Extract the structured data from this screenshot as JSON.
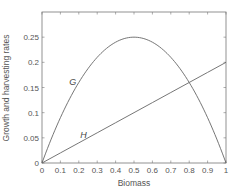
{
  "chart_data": {
    "type": "line",
    "title": "",
    "xlabel": "Biomass",
    "ylabel": "Growth and harvesting rates",
    "xlim": [
      0,
      1
    ],
    "ylim": [
      0,
      0.3
    ],
    "grid": false,
    "legend": "none (inline curve labels)",
    "x_ticks": [
      "0",
      "0.1",
      "0.2",
      "0.3",
      "0.4",
      "0.5",
      "0.6",
      "0.7",
      "0.8",
      "0.9",
      "1"
    ],
    "y_ticks": [
      "0",
      "0.05",
      "0.1",
      "0.15",
      "0.2",
      "0.25"
    ],
    "x": [
      0,
      0.1,
      0.2,
      0.3,
      0.4,
      0.5,
      0.6,
      0.7,
      0.8,
      0.9,
      1.0
    ],
    "series": [
      {
        "name": "G",
        "description": "logistic growth curve",
        "values": [
          0,
          0.09,
          0.16,
          0.21,
          0.24,
          0.25,
          0.24,
          0.21,
          0.16,
          0.09,
          0
        ],
        "color": "#666666"
      },
      {
        "name": "H",
        "description": "harvesting line",
        "values": [
          0,
          0.02,
          0.04,
          0.06,
          0.08,
          0.1,
          0.12,
          0.14,
          0.16,
          0.18,
          0.2
        ],
        "color": "#666666"
      }
    ],
    "annotations": [
      {
        "text": "G",
        "x": 0.17,
        "y": 0.16
      },
      {
        "text": "H",
        "x": 0.23,
        "y": 0.055
      }
    ]
  }
}
